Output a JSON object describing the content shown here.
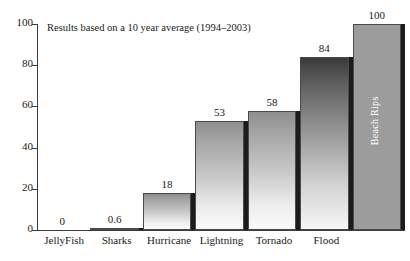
{
  "chart_data": {
    "type": "bar",
    "title": "Results based on a 10 year average (1994–2003)",
    "xlabel": "",
    "ylabel": "",
    "ylim": [
      0,
      100
    ],
    "yticks": [
      0,
      20,
      40,
      60,
      80,
      100
    ],
    "ytick_labels": [
      "0",
      "20",
      "40",
      "60",
      "80",
      "100"
    ],
    "grid": false,
    "legend": "none",
    "categories": [
      "JellyFish",
      "Sharks",
      "Hurricane",
      "Lightning",
      "Tornado",
      "Flood",
      "Beach Rips"
    ],
    "values": [
      0,
      0.6,
      18,
      53,
      58,
      84,
      100
    ],
    "value_labels": [
      "0",
      "0.6",
      "18",
      "53",
      "58",
      "84",
      "100"
    ],
    "annotations": [
      {
        "text": "Beach Rips",
        "placement": "inside-bar-vertical",
        "series_index": 6,
        "color": "#ffffff"
      }
    ],
    "bars": [
      {
        "category": "JellyFish",
        "value": 0,
        "label": "0",
        "axis_label": "JellyFish",
        "style": "gradient",
        "inner_label": ""
      },
      {
        "category": "Sharks",
        "value": 0.6,
        "label": "0.6",
        "axis_label": "Sharks",
        "style": "gradient",
        "inner_label": ""
      },
      {
        "category": "Hurricane",
        "value": 18,
        "label": "18",
        "axis_label": "Hurricane",
        "style": "gradient",
        "inner_label": ""
      },
      {
        "category": "Lightning",
        "value": 53,
        "label": "53",
        "axis_label": "Lightning",
        "style": "gradient",
        "inner_label": ""
      },
      {
        "category": "Tornado",
        "value": 58,
        "label": "58",
        "axis_label": "Tornado",
        "style": "gradient",
        "inner_label": ""
      },
      {
        "category": "Flood",
        "value": 84,
        "label": "84",
        "axis_label": "Flood",
        "style": "dark-top",
        "inner_label": ""
      },
      {
        "category": "Beach Rips",
        "value": 100,
        "label": "100",
        "axis_label": "",
        "style": "flat",
        "inner_label": "Beach Rips"
      }
    ],
    "colors": {
      "axis": "#3b3b3b",
      "bar_outline": "#4a4a4a",
      "bar_shadow": "#1c1c1c",
      "bar_fill_top": "#8e8e8e",
      "bar_fill_bottom": "#fafafa",
      "bar_flat_fill": "#9c9c9c",
      "text": "#1a1a1a",
      "background": "#ffffff"
    }
  }
}
